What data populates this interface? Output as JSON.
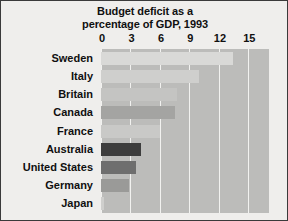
{
  "chart_data": {
    "type": "bar",
    "orientation": "horizontal",
    "title": "Budget deficit as a percentage of GDP, 1993",
    "title_lines": [
      "Budget deficit as a",
      "percentage of GDP, 1993"
    ],
    "xlabel": "",
    "ylabel": "",
    "xlim": [
      0,
      17.1
    ],
    "xticks": [
      0,
      3,
      6,
      9,
      12,
      15
    ],
    "xtick_labels": [
      "0",
      "3",
      "6",
      "9",
      "12",
      "15"
    ],
    "axis_position": "top",
    "grid": "vertical-white",
    "legend": "none",
    "categories": [
      "Sweden",
      "Italy",
      "Britain",
      "Canada",
      "France",
      "Australia",
      "United States",
      "Germany",
      "Japan"
    ],
    "values": [
      13.4,
      10.0,
      7.7,
      7.5,
      6.0,
      4.1,
      3.6,
      2.8,
      0.3
    ],
    "bar_colors": [
      "#d9d9d7",
      "#cfcfcd",
      "#c4c4c2",
      "#a4a4a2",
      "#c9c9c7",
      "#3d3d3d",
      "#6e6e6e",
      "#9a9a98",
      "#cfcfcd"
    ]
  },
  "colors": {
    "page_background": "#efeeec",
    "plot_background": "#bcbcba",
    "gridline": "#f2f2f0",
    "text": "#101010",
    "border": "#3a3a3a"
  }
}
